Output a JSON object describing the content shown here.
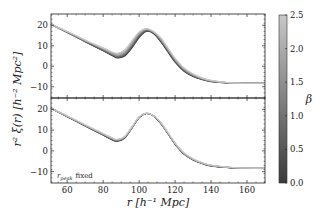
{
  "chart_data": {
    "type": "line",
    "title": "",
    "xlabel": "r [h^-1 Mpc]",
    "ylabel": "r^2 ξ(r) [h^-2 Mpc^2]",
    "xlim": [
      51,
      170
    ],
    "x_ticks": [
      60,
      80,
      100,
      120,
      140,
      160
    ],
    "grid": false,
    "colorbar": {
      "label": "β",
      "range": [
        0.0,
        2.5
      ],
      "ticks": [
        "0.0",
        "0.5",
        "1.0",
        "1.5",
        "2.0",
        "2.5"
      ],
      "colors": [
        "#3a3a3a",
        "#c8c8c8"
      ]
    },
    "panels": [
      {
        "name": "top",
        "annotation": "",
        "ylim": [
          -15.5,
          25.5
        ],
        "y_ticks": [
          -10,
          0,
          10,
          20
        ],
        "x": [
          51,
          60,
          70,
          80,
          85,
          88,
          92,
          96,
          100,
          104,
          108,
          112,
          116,
          120,
          125,
          130,
          135,
          140,
          150,
          160,
          170
        ],
        "series": [
          {
            "name": "beta=0.0",
            "values": [
              20.5,
              16.5,
              12.0,
              7.5,
              5.2,
              4.0,
              5.0,
              9.0,
              14.0,
              17.0,
              16.0,
              12.0,
              7.0,
              2.0,
              -2.5,
              -5.0,
              -6.5,
              -7.5,
              -8.2,
              -8.3,
              -8.3
            ]
          },
          {
            "name": "beta=1.25",
            "values": [
              20.5,
              16.7,
              12.4,
              8.2,
              6.0,
              5.0,
              6.2,
              10.6,
              15.4,
              17.8,
              16.6,
              13.0,
              8.0,
              3.0,
              -1.7,
              -4.4,
              -6.1,
              -7.2,
              -8.1,
              -8.3,
              -8.3
            ]
          },
          {
            "name": "beta=2.5",
            "values": [
              20.6,
              17.0,
              12.8,
              9.0,
              7.0,
              6.4,
              8.0,
              12.5,
              16.8,
              18.4,
              17.0,
              14.0,
              9.0,
              4.0,
              -0.8,
              -3.7,
              -5.7,
              -6.9,
              -8.0,
              -8.3,
              -8.3
            ]
          }
        ]
      },
      {
        "name": "bottom",
        "annotation": "r_peak fixed",
        "ylim": [
          -15.5,
          25.5
        ],
        "y_ticks": [
          -10,
          0,
          10,
          20
        ],
        "x": [
          51,
          60,
          70,
          80,
          85,
          88,
          92,
          96,
          100,
          104,
          108,
          112,
          116,
          120,
          125,
          130,
          135,
          140,
          150,
          160,
          170
        ],
        "series": [
          {
            "name": "beta=0.0",
            "values": [
              20.5,
              16.5,
              12.0,
              7.6,
              5.3,
              4.6,
              6.2,
              11.0,
              16.0,
              18.0,
              16.8,
              13.2,
              8.3,
              3.2,
              -1.6,
              -4.4,
              -6.1,
              -7.3,
              -8.1,
              -8.3,
              -8.3
            ]
          },
          {
            "name": "beta=1.25",
            "values": [
              20.5,
              16.7,
              12.3,
              8.0,
              5.8,
              5.1,
              6.6,
              11.3,
              16.2,
              18.1,
              16.9,
              13.5,
              8.6,
              3.5,
              -1.3,
              -4.1,
              -5.9,
              -7.1,
              -8.0,
              -8.3,
              -8.3
            ]
          },
          {
            "name": "beta=2.5",
            "values": [
              20.6,
              16.9,
              12.6,
              8.4,
              6.3,
              5.6,
              7.0,
              11.6,
              16.4,
              18.2,
              17.0,
              13.8,
              8.9,
              3.8,
              -1.0,
              -3.8,
              -5.7,
              -6.9,
              -7.9,
              -8.3,
              -8.3
            ]
          }
        ]
      }
    ]
  },
  "labels": {
    "ylabel_text": "r² ξ(r) [h⁻² Mpc²]",
    "xlabel_text": "r [h⁻¹ Mpc]",
    "colorbar_label": "β",
    "annotation_main": "r",
    "annotation_sub": "peak",
    "annotation_rest": "fixed"
  }
}
